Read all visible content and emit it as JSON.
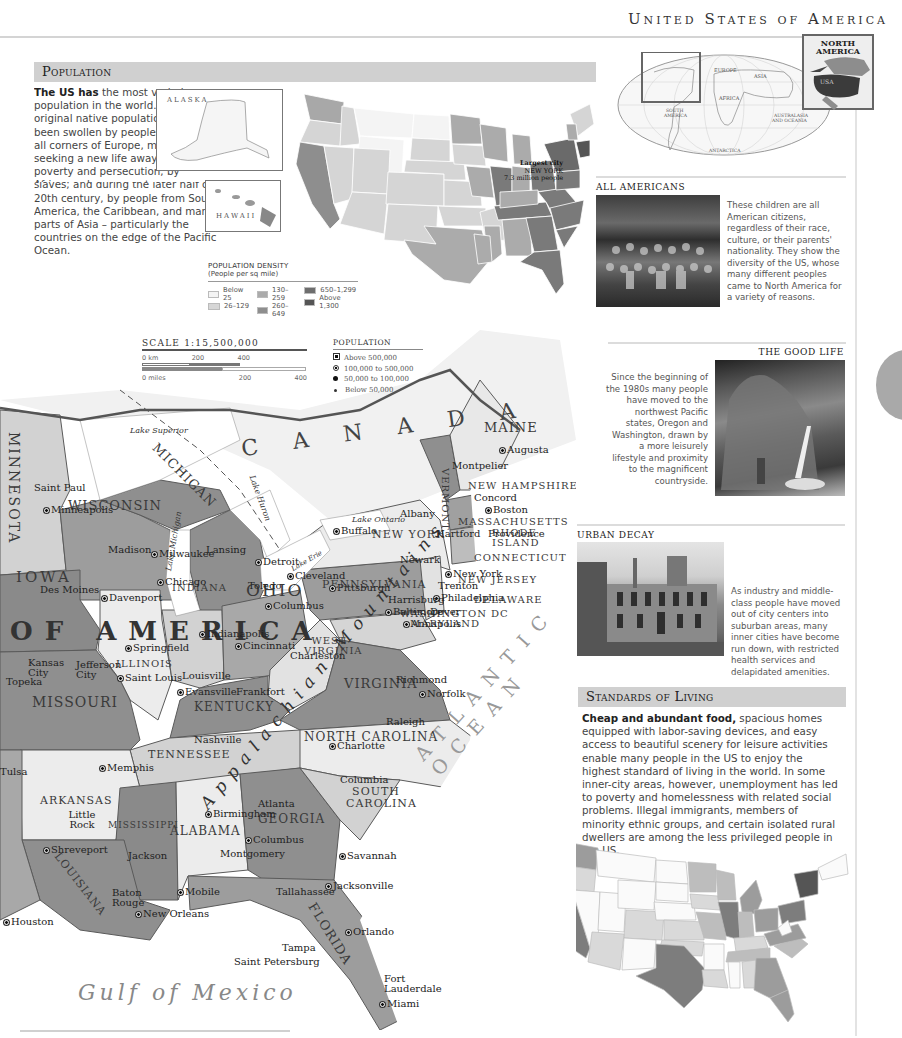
{
  "page": {
    "title": "United States of America"
  },
  "locator": {
    "world_labels": [
      "EUROPE",
      "ASIA",
      "AFRICA",
      "SOUTH AMERICA",
      "AUSTRALASIA AND OCEANIA",
      "ANTARCTICA"
    ],
    "inset_title_line1": "NORTH",
    "inset_title_line2": "AMERICA",
    "inset_highlight": "USA"
  },
  "population": {
    "heading": "Population",
    "lead": "The US has",
    "text": " the most varied population in the world. The original native population has been swollen by peoples from all corners of Europe, many seeking a new life away from poverty and persecution; by Africans whose ancestors were brought to the US as slaves; and during the later half of the 20th century, by people from South America, the Caribbean, and many parts of Asia – particularly the countries on the edge of the Pacific Ocean.",
    "alaska_label": "ALASKA",
    "hawaii_label": "HAWAII",
    "largest_city_line1": "Largest city",
    "largest_city_line2": "NEW YORK",
    "largest_city_line3": "7.3 million people",
    "legend": {
      "title": "POPULATION DENSITY",
      "subtitle": "(People per sq mile)",
      "items": [
        {
          "label": "Below 25",
          "color": "#f4f4f4"
        },
        {
          "label": "26–129",
          "color": "#d6d6d6"
        },
        {
          "label": "130–259",
          "color": "#ababab"
        },
        {
          "label": "260–649",
          "color": "#8e8e8e"
        },
        {
          "label": "650–1,299",
          "color": "#6e6e6e"
        },
        {
          "label": "Above 1,300",
          "color": "#555555"
        }
      ]
    }
  },
  "scale": {
    "title": "SCALE 1:15,500,000",
    "km_ticks": [
      "0 km",
      "200",
      "400"
    ],
    "mile_ticks": [
      "0 miles",
      "200",
      "400"
    ]
  },
  "population_legend": {
    "title": "POPULATION",
    "items": [
      "Above 500,000",
      "100,000 to 500,000",
      "50,000 to 100,000",
      "Below 50,000"
    ]
  },
  "all_americans": {
    "heading": "ALL AMERICANS",
    "text": "These children are all American citizens, regardless of their race, culture, or their parents' nationality. They show the diversity of the US, whose many different peoples came to North America for a variety of reasons."
  },
  "good_life": {
    "heading": "THE GOOD LIFE",
    "text": "Since the beginning of the 1980s many people have moved to the northwest Pacific states, Oregon and Washington, drawn by a more leisurely lifestyle and proximity to the magnificent countryside."
  },
  "urban_decay": {
    "heading": "URBAN DECAY",
    "text": "As industry and middle-class people have moved out of city centers into suburban areas, many inner cities have become run down, with restricted health services and delapidated amenities."
  },
  "standards": {
    "heading": "Standards of Living",
    "lead": "Cheap and abundant food,",
    "text": " spacious homes equipped with labor-saving devices, and easy access to beautiful scenery for leisure activities enable many people in the US to enjoy the highest standard of living in the world. In some inner-city areas, however, unemployment has led to poverty and homelessness with related social problems. Illegal immigrants, members of minority ethnic groups, and certain isolated rural dwellers are among the less privileged people in the US.",
    "alaska_label": "ALASKA",
    "hawaii_label": "HAWAII",
    "legend": {
      "title": "STANDARD OF LIVING",
      "subtitle": "(UN Human Development Index)",
      "low": "low",
      "high": "high",
      "colors": [
        "#fafafa",
        "#d9d9d9",
        "#bdbdbd",
        "#9c9c9c",
        "#7d7d7d"
      ]
    }
  },
  "map": {
    "country_labels": {
      "canada": "C A N A D A",
      "usa": "OF AMERICA"
    },
    "oceans": {
      "atlantic": "ATLANTIC OCEAN",
      "gulf": "Gulf of Mexico"
    },
    "mountains": "Appalachian Mountains",
    "lakes": [
      "Lake Superior",
      "Lake Michigan",
      "Lake Huron",
      "Lake Erie",
      "Lake Ontario"
    ],
    "states": [
      "MINNESOTA",
      "WISCONSIN",
      "MICHIGAN",
      "IOWA",
      "ILLINOIS",
      "INDIANA",
      "OHIO",
      "PENNSYLVANIA",
      "NEW YORK",
      "VERMONT",
      "NEW HAMPSHIRE",
      "MAINE",
      "MASSACHUSETTS",
      "RHODE ISLAND",
      "CONNECTICUT",
      "NEW JERSEY",
      "DELAWARE",
      "MARYLAND",
      "WASHINGTON DC",
      "WEST VIRGINIA",
      "VIRGINIA",
      "KENTUCKY",
      "MISSOURI",
      "TENNESSEE",
      "NORTH CAROLINA",
      "SOUTH CAROLINA",
      "GEORGIA",
      "ALABAMA",
      "MISSISSIPPI",
      "ARKANSAS",
      "LOUISIANA",
      "FLORIDA"
    ],
    "cities": [
      "Saint Paul",
      "Minneapolis",
      "Madison",
      "Milwaukee",
      "Lansing",
      "Detroit",
      "Chicago",
      "Des Moines",
      "Davenport",
      "Toledo",
      "Cleveland",
      "Buffalo",
      "Albany",
      "Montpelier",
      "Augusta",
      "Concord",
      "Boston",
      "Providence",
      "Hartford",
      "Newark",
      "New York",
      "Trenton",
      "Philadelphia",
      "Harrisburg",
      "Pittsburgh",
      "Baltimore",
      "Dover",
      "Annapolis",
      "Columbus",
      "Indianapolis",
      "Springfield",
      "Cincinnati",
      "Charleston",
      "Kansas City",
      "Topeka",
      "Jefferson City",
      "Saint Louis",
      "Louisville",
      "Evansville",
      "Frankfort",
      "Richmond",
      "Norfolk",
      "Raleigh",
      "Charlotte",
      "Nashville",
      "Memphis",
      "Little Rock",
      "Tulsa",
      "Atlanta",
      "Birmingham",
      "Columbus",
      "Montgomery",
      "Columbia",
      "Savannah",
      "Jacksonville",
      "Tallahassee",
      "Jackson",
      "Shreveport",
      "Baton Rouge",
      "New Orleans",
      "Mobile",
      "Houston",
      "Orlando",
      "Tampa",
      "Saint Petersburg",
      "Fort Lauderdale",
      "Miami"
    ]
  }
}
